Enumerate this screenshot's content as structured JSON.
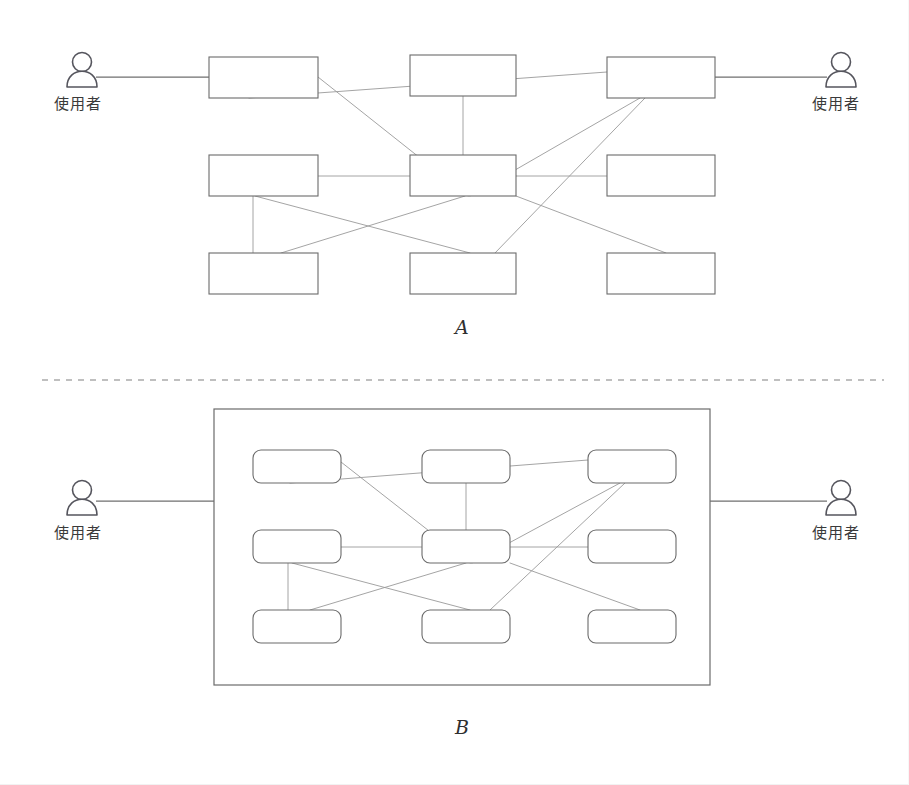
{
  "page": {
    "width": 909,
    "height": 785,
    "background": "#ffffff",
    "stroke_color": "#6b6b6b",
    "edge_color": "#9a9a9a",
    "divider_color": "#aaaaaa"
  },
  "diagram_a": {
    "label": "A",
    "actor_left_label": "使用者",
    "actor_right_label": "使用者",
    "node_style": "square",
    "nodes": [
      {
        "id": "a-r1c1",
        "x": 209,
        "y": 57,
        "w": 109,
        "h": 41
      },
      {
        "id": "a-r1c2",
        "x": 410,
        "y": 55,
        "w": 106,
        "h": 41
      },
      {
        "id": "a-r1c3",
        "x": 607,
        "y": 57,
        "w": 108,
        "h": 41
      },
      {
        "id": "a-r2c1",
        "x": 209,
        "y": 155,
        "w": 109,
        "h": 41
      },
      {
        "id": "a-r2c2",
        "x": 410,
        "y": 155,
        "w": 106,
        "h": 41
      },
      {
        "id": "a-r2c3",
        "x": 607,
        "y": 155,
        "w": 108,
        "h": 41
      },
      {
        "id": "a-r3c1",
        "x": 209,
        "y": 253,
        "w": 109,
        "h": 41
      },
      {
        "id": "a-r3c2",
        "x": 410,
        "y": 253,
        "w": 106,
        "h": 41
      },
      {
        "id": "a-r3c3",
        "x": 607,
        "y": 253,
        "w": 108,
        "h": 41
      }
    ],
    "actor_left": {
      "cx": 82,
      "cy": 75
    },
    "actor_right": {
      "cx": 841,
      "cy": 75
    },
    "actor_link_left": {
      "x1": 96,
      "y1": 77,
      "x2": 209,
      "y2": 77
    },
    "actor_link_right": {
      "x1": 715,
      "y1": 77,
      "x2": 827,
      "y2": 77
    },
    "edges": [
      {
        "x1": 318,
        "y1": 77,
        "x2": 468,
        "y2": 196
      },
      {
        "x1": 249,
        "y1": 98,
        "x2": 607,
        "y2": 72
      },
      {
        "x1": 463,
        "y1": 96,
        "x2": 463,
        "y2": 155
      },
      {
        "x1": 640,
        "y1": 98,
        "x2": 470,
        "y2": 196
      },
      {
        "x1": 318,
        "y1": 176,
        "x2": 516,
        "y2": 176
      },
      {
        "x1": 516,
        "y1": 176,
        "x2": 607,
        "y2": 176
      },
      {
        "x1": 253,
        "y1": 196,
        "x2": 253,
        "y2": 253
      },
      {
        "x1": 255,
        "y1": 196,
        "x2": 470,
        "y2": 253
      },
      {
        "x1": 465,
        "y1": 196,
        "x2": 281,
        "y2": 253
      },
      {
        "x1": 516,
        "y1": 196,
        "x2": 666,
        "y2": 253
      },
      {
        "x1": 645,
        "y1": 98,
        "x2": 495,
        "y2": 253
      }
    ]
  },
  "divider": {
    "y": 380,
    "x1": 42,
    "x2": 884,
    "style": "dashed"
  },
  "diagram_b": {
    "label": "B",
    "actor_left_label": "使用者",
    "actor_right_label": "使用者",
    "node_style": "rounded",
    "container": {
      "x": 214,
      "y": 409,
      "w": 496,
      "h": 276
    },
    "nodes": [
      {
        "id": "b-r1c1",
        "x": 253,
        "y": 450,
        "w": 88,
        "h": 33
      },
      {
        "id": "b-r1c2",
        "x": 422,
        "y": 450,
        "w": 88,
        "h": 33
      },
      {
        "id": "b-r1c3",
        "x": 588,
        "y": 450,
        "w": 88,
        "h": 33
      },
      {
        "id": "b-r2c1",
        "x": 253,
        "y": 530,
        "w": 88,
        "h": 33
      },
      {
        "id": "b-r2c2",
        "x": 422,
        "y": 530,
        "w": 88,
        "h": 33
      },
      {
        "id": "b-r2c3",
        "x": 588,
        "y": 530,
        "w": 88,
        "h": 33
      },
      {
        "id": "b-r3c1",
        "x": 253,
        "y": 610,
        "w": 88,
        "h": 33
      },
      {
        "id": "b-r3c2",
        "x": 422,
        "y": 610,
        "w": 88,
        "h": 33
      },
      {
        "id": "b-r3c3",
        "x": 588,
        "y": 610,
        "w": 88,
        "h": 33
      }
    ],
    "actor_left": {
      "cx": 82,
      "cy": 503
    },
    "actor_right": {
      "cx": 841,
      "cy": 503
    },
    "actor_link_left": {
      "x1": 96,
      "y1": 501,
      "x2": 214,
      "y2": 501
    },
    "actor_link_right": {
      "x1": 710,
      "y1": 501,
      "x2": 827,
      "y2": 501
    },
    "edges": [
      {
        "x1": 341,
        "y1": 462,
        "x2": 470,
        "y2": 563
      },
      {
        "x1": 290,
        "y1": 483,
        "x2": 588,
        "y2": 460
      },
      {
        "x1": 466,
        "y1": 483,
        "x2": 466,
        "y2": 530
      },
      {
        "x1": 620,
        "y1": 483,
        "x2": 472,
        "y2": 563
      },
      {
        "x1": 341,
        "y1": 547,
        "x2": 422,
        "y2": 547
      },
      {
        "x1": 510,
        "y1": 547,
        "x2": 588,
        "y2": 547
      },
      {
        "x1": 288,
        "y1": 563,
        "x2": 288,
        "y2": 610
      },
      {
        "x1": 292,
        "y1": 563,
        "x2": 470,
        "y2": 610
      },
      {
        "x1": 466,
        "y1": 563,
        "x2": 310,
        "y2": 610
      },
      {
        "x1": 510,
        "y1": 563,
        "x2": 640,
        "y2": 610
      },
      {
        "x1": 625,
        "y1": 483,
        "x2": 490,
        "y2": 610
      }
    ]
  }
}
